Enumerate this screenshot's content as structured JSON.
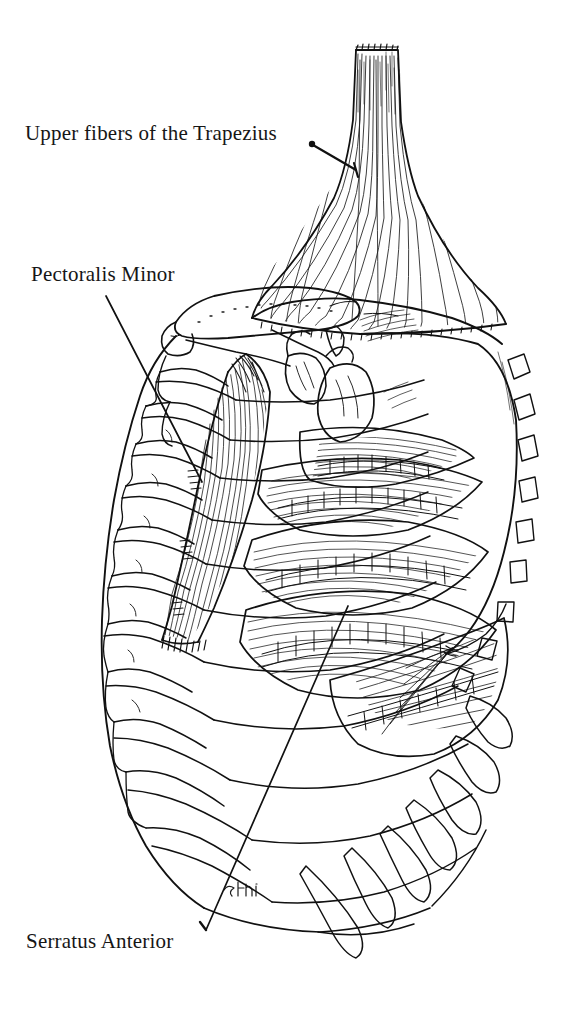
{
  "figure": {
    "background_color": "#ffffff",
    "ink_color": "#111111",
    "width": 563,
    "height": 1020
  },
  "labels": [
    {
      "id": "trapezius",
      "text": "Upper fibers of the Trapezius",
      "leader": {
        "dot_x": 312,
        "dot_y": 144,
        "end_x": 356,
        "end_y": 170
      }
    },
    {
      "id": "pectoralis-minor",
      "text": "Pectoralis Minor",
      "leader": {
        "dot_x": 106,
        "dot_y": 296,
        "end_x": 200,
        "end_y": 479
      }
    },
    {
      "id": "serratus-anterior",
      "text": "Serratus Anterior",
      "leader": {
        "dot_x": 205,
        "dot_y": 930,
        "end_x": 345,
        "end_y": 612
      }
    }
  ],
  "structures": [
    {
      "name": "trapezius-muscle",
      "kind": "muscle"
    },
    {
      "name": "pectoralis-minor-muscle",
      "kind": "muscle"
    },
    {
      "name": "serratus-anterior-muscle",
      "kind": "muscle"
    },
    {
      "name": "clavicle",
      "kind": "bone"
    },
    {
      "name": "scapula",
      "kind": "bone"
    },
    {
      "name": "coracoid-process",
      "kind": "bone"
    },
    {
      "name": "humeral-head",
      "kind": "bone"
    },
    {
      "name": "ribs",
      "kind": "bone"
    },
    {
      "name": "costal-cartilages",
      "kind": "cartilage"
    },
    {
      "name": "sternum",
      "kind": "bone"
    }
  ],
  "artist_signature": {
    "present": true,
    "text": "",
    "x": 228,
    "y": 888
  }
}
